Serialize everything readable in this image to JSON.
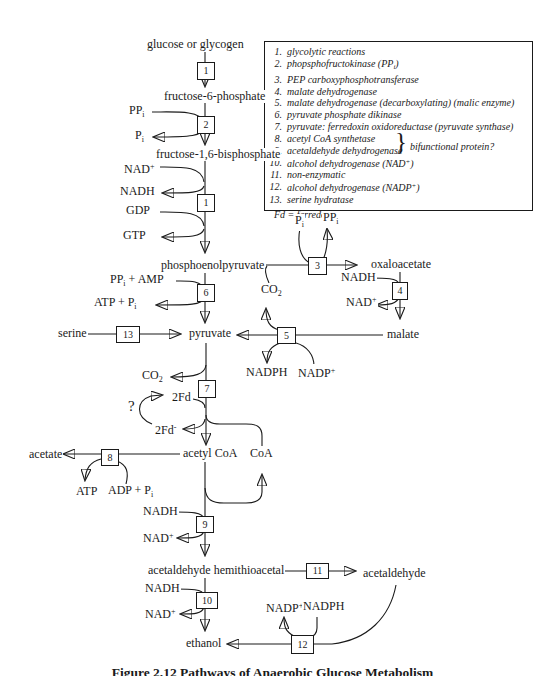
{
  "legend": {
    "items": [
      {
        "num": "1.",
        "html": "glycolytic reactions"
      },
      {
        "num": "2.",
        "html": "phopsphofructokinase (PP<sub>i</sub>)"
      },
      {
        "num": "3.",
        "html": "PEP carboxyphosphotransferase"
      },
      {
        "num": "4.",
        "html": "malate dehydrogenase"
      },
      {
        "num": "5.",
        "html": "malate dehydrogenase (decarboxylating) (malic enzyme)"
      },
      {
        "num": "6.",
        "html": "pyruvate phosphate dikinase"
      },
      {
        "num": "7.",
        "html": "pyruvate: ferredoxin oxidoreductase (pyruvate synthase)"
      },
      {
        "num": "8.",
        "html": "acetyl CoA synthetase"
      },
      {
        "num": "9.",
        "html": "acetaldehyde dehydrogenase"
      },
      {
        "num": "10.",
        "html": "alcohol dehydrogenase (NAD<sup>+</sup>)"
      },
      {
        "num": "11.",
        "html": "non-enzymatic"
      },
      {
        "num": "12.",
        "html": "alcohol dehydrogenase (NADP<sup>+</sup>)"
      },
      {
        "num": "13.",
        "html": "serine hydratase"
      }
    ],
    "brace": "}",
    "brace_note": "bifunctional protein?",
    "footnote": "Fd = ferredoxin"
  },
  "metabolites": {
    "glucose": "glucose or glycogen",
    "f6p": "fructose-6-phosphate",
    "fbp": "fructose-1,6-bisphosphate",
    "pep": "phosphoenolpyruvate",
    "pyruvate": "pyruvate",
    "serine": "serine",
    "oxaloacetate": "oxaloacetate",
    "malate": "malate",
    "acetate": "acetate",
    "acetyl_coa": "acetyl CoA",
    "coa": "CoA",
    "hemithioacetal": "acetaldehyde hemithioacetal",
    "acetaldehyde": "acetaldehyde",
    "ethanol": "ethanol"
  },
  "cofactors": {
    "ppi2": "PP<sub>i</sub>",
    "pi2": "P<sub>i</sub>",
    "nad1": "NAD<sup>+</sup>",
    "nadh1": "NADH",
    "gdp": "GDP",
    "gtp": "GTP",
    "ppi_amp": "PP<sub>i</sub> + AMP",
    "atp_pi": "ATP +  P<sub>i</sub>",
    "pi3": "P<sub>i</sub>",
    "ppi3": "PP<sub>i</sub>",
    "co2_3": "CO<sub>2</sub>",
    "nadh4": "NADH",
    "nad4": "NAD<sup>+</sup>",
    "nadph5": "NADPH",
    "nadp5": "NADP<sup>+</sup>",
    "co2_7": "CO<sub>2</sub>",
    "fd_ox": "2Fd",
    "fd_red": "2Fd<sup>-</sup>",
    "question": "?",
    "atp8": "ATP",
    "adp_pi8": "ADP + P<sub>i</sub>",
    "nadh9": "NADH",
    "nad9": "NAD<sup>+</sup>",
    "nadh10": "NADH",
    "nad10": "NAD<sup>+</sup>",
    "nadp12": "NADP<sup>+</sup>",
    "nadph12": "NADPH"
  },
  "boxes": {
    "b1a": "1",
    "b2": "2",
    "b1b": "1",
    "b3": "3",
    "b4": "4",
    "b5": "5",
    "b6": "6",
    "b7": "7",
    "b8": "8",
    "b9": "9",
    "b10": "10",
    "b11": "11",
    "b12": "12",
    "b13": "13"
  },
  "caption": "Figure 2.12 Pathways of Anaerobic Glucose Metabolism"
}
